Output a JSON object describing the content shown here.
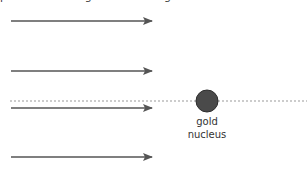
{
  "diagram": {
    "caption_partial": "particles moving towards the gold nucleus",
    "nucleus": {
      "label_line1": "gold",
      "label_line2": "nucleus",
      "color": "#4a4a4a",
      "stroke": "#333333"
    },
    "arrow_color": "#555555",
    "dotted_line_color": "#999999",
    "arrows": [
      {
        "name": "alpha-particle-path-1",
        "y": 21
      },
      {
        "name": "alpha-particle-path-2",
        "y": 71
      },
      {
        "name": "alpha-particle-path-3",
        "y": 108
      },
      {
        "name": "alpha-particle-path-4",
        "y": 157
      }
    ]
  }
}
